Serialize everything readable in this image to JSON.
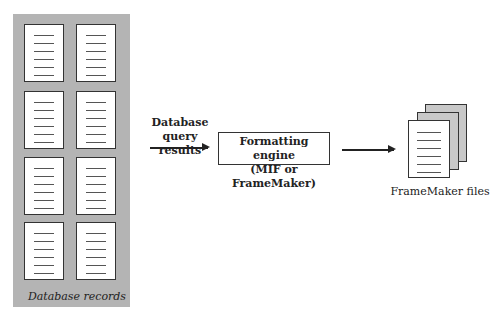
{
  "diagram": {
    "source": {
      "caption": "Database records",
      "record_count": 8,
      "grid": {
        "columns": 2,
        "rows": 4
      },
      "panel_color": "#b4b4b4"
    },
    "edge1": {
      "label_line1": "Database",
      "label_line2": "query results"
    },
    "engine": {
      "line1": "Formatting engine",
      "line2": "(MIF or FrameMaker)"
    },
    "output": {
      "label": "FrameMaker files",
      "stack_count": 3,
      "back_color": "#c8c8c8"
    }
  }
}
